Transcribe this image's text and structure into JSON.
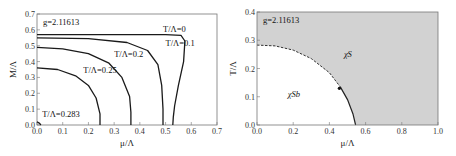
{
  "chart_data": [
    {
      "type": "line",
      "title": "",
      "annotation": "g=2.11613",
      "xlabel": "μ/Λ",
      "ylabel": "M/Λ",
      "xlim": [
        0,
        0.7
      ],
      "ylim": [
        0,
        0.7
      ],
      "xticks": [
        "0.0",
        "0.1",
        "0.2",
        "0.3",
        "0.4",
        "0.5",
        "0.6",
        "0.7"
      ],
      "yticks": [
        "0.0",
        "0.1",
        "0.2",
        "0.3",
        "0.4",
        "0.5",
        "0.6",
        "0.7"
      ],
      "series": [
        {
          "name": "T/Λ=0",
          "x": [
            0,
            0.3,
            0.5,
            0.56,
            0.575,
            0.57,
            0.55,
            0.535,
            0.53,
            0.528
          ],
          "y": [
            0.57,
            0.57,
            0.57,
            0.565,
            0.53,
            0.4,
            0.25,
            0.12,
            0.05,
            0
          ]
        },
        {
          "name": "T/Λ=0.1",
          "x": [
            0,
            0.2,
            0.35,
            0.43,
            0.47,
            0.485,
            0.49,
            0.49
          ],
          "y": [
            0.55,
            0.545,
            0.52,
            0.47,
            0.38,
            0.25,
            0.1,
            0
          ]
        },
        {
          "name": "T/Λ=0.2",
          "x": [
            0,
            0.1,
            0.2,
            0.28,
            0.33,
            0.36,
            0.365,
            0.365
          ],
          "y": [
            0.49,
            0.48,
            0.45,
            0.39,
            0.3,
            0.18,
            0.08,
            0
          ]
        },
        {
          "name": "T/Λ=0.25",
          "x": [
            0,
            0.08,
            0.15,
            0.2,
            0.23,
            0.245,
            0.245
          ],
          "y": [
            0.36,
            0.35,
            0.31,
            0.25,
            0.17,
            0.07,
            0
          ]
        },
        {
          "name": "T/Λ=0.283",
          "x": [
            0,
            0.01,
            0.015
          ],
          "y": [
            0.02,
            0.01,
            0
          ]
        }
      ],
      "labels": [
        {
          "text": "T/Λ=0",
          "x": 0.49,
          "y": 0.585
        },
        {
          "text": "T/Λ=0.1",
          "x": 0.5,
          "y": 0.5
        },
        {
          "text": "T/Λ=0.2",
          "x": 0.3,
          "y": 0.43
        },
        {
          "text": "T/Λ=0.25",
          "x": 0.18,
          "y": 0.33
        },
        {
          "text": "T/Λ=0.283",
          "x": 0.02,
          "y": 0.05
        }
      ]
    },
    {
      "type": "area",
      "title": "",
      "annotation": "g=2.11613",
      "xlabel": "μ/Λ",
      "ylabel": "T/Λ",
      "xlim": [
        0,
        1.0
      ],
      "ylim": [
        0,
        0.4
      ],
      "xticks": [
        "0.0",
        "0.2",
        "0.4",
        "0.6",
        "0.8",
        "1.0"
      ],
      "yticks": [
        "0.0",
        "0.1",
        "0.2",
        "0.3",
        "0.4"
      ],
      "boundary": {
        "x": [
          0,
          0.1,
          0.2,
          0.3,
          0.4,
          0.46,
          0.5,
          0.53,
          0.545
        ],
        "y": [
          0.283,
          0.28,
          0.265,
          0.235,
          0.185,
          0.135,
          0.09,
          0.04,
          0
        ]
      },
      "critical_point": {
        "x": 0.455,
        "y": 0.13
      },
      "regions": [
        {
          "label": "χS",
          "x": 0.48,
          "y": 0.24,
          "fill": "#d2d2d2"
        },
        {
          "label": "χSb",
          "x": 0.17,
          "y": 0.1,
          "fill": "#ffffff"
        }
      ]
    }
  ]
}
